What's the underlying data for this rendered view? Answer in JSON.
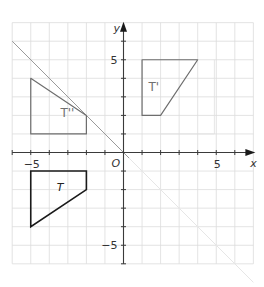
{
  "chart_data": {
    "type": "coordinate-grid",
    "xlabel": "x",
    "ylabel": "y",
    "origin_label": "O",
    "x_range": [
      -6,
      7
    ],
    "y_range": [
      -6,
      7
    ],
    "x_tick_labels": [
      {
        "value": -5,
        "label": "−5"
      },
      {
        "value": 5,
        "label": "5"
      }
    ],
    "y_tick_labels": [
      {
        "value": 5,
        "label": "5"
      },
      {
        "value": -5,
        "label": "−5"
      }
    ],
    "grid": true,
    "mirror_line": {
      "equation": "y = -x",
      "from": [
        -6,
        6
      ],
      "to": [
        7,
        -7
      ]
    },
    "shapes": [
      {
        "name": "T",
        "label": "T",
        "style": "ink",
        "vertices": [
          [
            -5,
            -1
          ],
          [
            -2,
            -1
          ],
          [
            -2,
            -2
          ],
          [
            -5,
            -4
          ]
        ],
        "label_pos": [
          -3.6,
          -2.1
        ]
      },
      {
        "name": "T''",
        "label": "T''",
        "style": "pencil",
        "vertices": [
          [
            -5,
            4
          ],
          [
            -2,
            2
          ],
          [
            -2,
            1
          ],
          [
            -5,
            1
          ]
        ],
        "label_pos": [
          -3.4,
          1.9
        ]
      },
      {
        "name": "T'",
        "label": "T'",
        "style": "pencil",
        "vertices": [
          [
            1,
            5
          ],
          [
            4,
            5
          ],
          [
            2,
            2
          ],
          [
            1,
            2
          ]
        ],
        "label_pos": [
          1.35,
          3.3
        ]
      }
    ],
    "faint_construction": [
      [
        [
          4.9,
          5
        ],
        [
          4.9,
          1
        ]
      ],
      [
        [
          2,
          1
        ],
        [
          4.9,
          1
        ]
      ]
    ]
  },
  "labels": {
    "x_axis": "x",
    "y_axis": "y",
    "origin": "O",
    "x_neg5": "−5",
    "x_pos5": "5",
    "y_pos5": "5",
    "y_neg5": "−5",
    "shape_t": "T",
    "shape_t_prime": "T'",
    "shape_t_double_prime": "T''"
  }
}
